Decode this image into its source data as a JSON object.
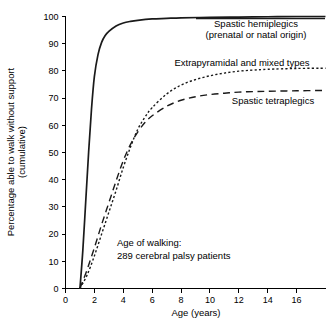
{
  "chart_data": {
    "type": "line",
    "title": "",
    "xlabel": "Age (years)",
    "ylabel": "Percentage able to walk without support (cumulative)",
    "ylabel_line1": "Percentage able to walk without support",
    "ylabel_line2": "(cumulative)",
    "xlim": [
      0,
      18
    ],
    "ylim": [
      0,
      100
    ],
    "xticks": [
      0,
      2,
      4,
      6,
      8,
      10,
      12,
      14,
      16
    ],
    "xtick_labels": [
      "0",
      "2",
      "4",
      "6",
      "8",
      "10",
      "12",
      "14",
      "16"
    ],
    "yticks": [
      0,
      10,
      20,
      30,
      40,
      50,
      60,
      70,
      80,
      90,
      100
    ],
    "ytick_labels": [
      "0",
      "10",
      "20",
      "30",
      "40",
      "50",
      "60",
      "70",
      "80",
      "90",
      "100"
    ],
    "grid": false,
    "legend_position": "inline-annotations",
    "annotations": [
      {
        "text": "Age of walking:",
        "x": 5.2,
        "y": 16
      },
      {
        "text": "289 cerebral palsy patients",
        "x": 5.2,
        "y": 10
      }
    ],
    "series": [
      {
        "name": "Spastic hemiplegics (prenatal or natal origin)",
        "label_line1": "Spastic hemiplegics",
        "label_line2": "(prenatal or natal origin)",
        "style": "solid",
        "color": "#1a1a1a",
        "x": [
          1.0,
          1.2,
          1.4,
          1.6,
          1.8,
          2.0,
          2.25,
          2.5,
          2.75,
          3.0,
          3.5,
          4.0,
          4.5,
          5.0,
          6.0,
          7.0,
          8.0,
          10.0,
          12.0,
          14.0,
          16.0,
          18.0
        ],
        "values": [
          0,
          14,
          32,
          50,
          66,
          78,
          86,
          90.5,
          93,
          94.5,
          96.5,
          97.6,
          98.2,
          98.6,
          99.1,
          99.3,
          99.5,
          99.7,
          99.8,
          99.9,
          100,
          100
        ]
      },
      {
        "name": "Extrapyramidal and mixed types",
        "label_line1": "Extrapyramidal and mixed types",
        "label_line2": "",
        "style": "dotted",
        "color": "#1a1a1a",
        "x": [
          1.0,
          1.5,
          2.0,
          2.5,
          3.0,
          3.5,
          4.0,
          4.5,
          5.0,
          5.5,
          6.0,
          7.0,
          8.0,
          9.0,
          10.0,
          11.0,
          12.0,
          13.0,
          14.0,
          16.0,
          18.0
        ],
        "values": [
          0,
          5,
          12,
          20,
          28,
          36,
          44.5,
          52,
          58.5,
          63,
          66.5,
          71.5,
          74.8,
          76.8,
          78.2,
          79.2,
          79.9,
          80.3,
          80.6,
          80.9,
          81.0
        ]
      },
      {
        "name": "Spastic tetraplegics",
        "label_line1": "Spastic tetraplegics",
        "label_line2": "",
        "style": "dashed",
        "color": "#1a1a1a",
        "x": [
          1.0,
          1.5,
          2.0,
          2.5,
          3.0,
          3.5,
          4.0,
          4.5,
          5.0,
          5.5,
          6.0,
          7.0,
          8.0,
          9.0,
          10.0,
          11.0,
          12.0,
          13.0,
          14.0,
          16.0,
          18.0
        ],
        "values": [
          0,
          7,
          15,
          23.5,
          31.5,
          39.5,
          47,
          53,
          57.5,
          61,
          63.5,
          67,
          69.2,
          70.5,
          71.3,
          71.8,
          72.2,
          72.4,
          72.5,
          72.7,
          72.8
        ]
      }
    ]
  }
}
